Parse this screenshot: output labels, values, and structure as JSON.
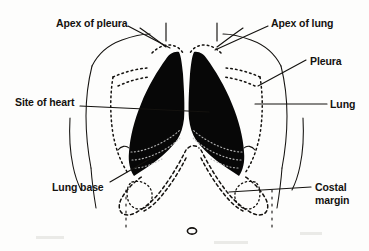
{
  "figure": {
    "background_color": "#fdfdfc",
    "ink_color": "#14120f",
    "lung_fill_color": "#070707"
  },
  "labels": [
    {
      "id": "apex-of-pleura",
      "text": "Apex of pleura",
      "side": "left",
      "x": 56,
      "y": 17
    },
    {
      "id": "apex-of-lung",
      "text": "Apex of lung",
      "side": "right",
      "x": 271,
      "y": 17
    },
    {
      "id": "pleura",
      "text": "Pleura",
      "side": "right",
      "x": 310,
      "y": 55
    },
    {
      "id": "lung",
      "text": "Lung",
      "side": "right",
      "x": 330,
      "y": 98
    },
    {
      "id": "site-of-heart",
      "text": "Site of heart",
      "side": "left",
      "x": 15,
      "y": 96
    },
    {
      "id": "lung-base",
      "text": "Lung base",
      "side": "left",
      "x": 52,
      "y": 181
    },
    {
      "id": "costal-margin",
      "text": "Costal\nmargin",
      "side": "right",
      "x": 315,
      "y": 181
    }
  ],
  "structures": [
    {
      "id": "torso-outline",
      "label": "Torso outline",
      "style": "solid-thin"
    },
    {
      "id": "left-lung",
      "label": "Left lung",
      "style": "solid-black-fill"
    },
    {
      "id": "right-lung",
      "label": "Right lung",
      "style": "solid-black-fill"
    },
    {
      "id": "pleural-outline",
      "label": "Pleural reflection",
      "style": "dotted"
    },
    {
      "id": "costal-margin-line",
      "label": "Costal margin",
      "style": "dashed"
    },
    {
      "id": "umbilicus",
      "label": "Umbilicus",
      "style": "small-oval"
    },
    {
      "id": "clavicle-left",
      "label": "Left clavicle",
      "style": "solid-thin"
    },
    {
      "id": "clavicle-right",
      "label": "Right clavicle",
      "style": "solid-thin"
    }
  ]
}
